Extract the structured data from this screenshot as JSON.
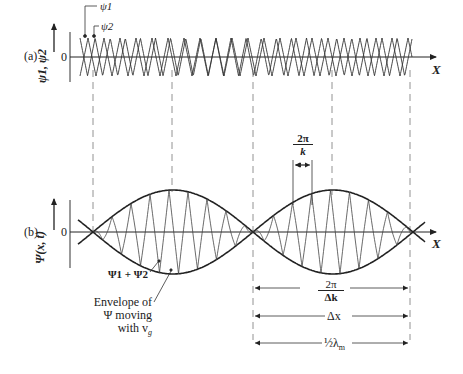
{
  "panel_a": {
    "label": "(a)",
    "y_axis_label": "ψ1, ψ2",
    "zero_label": "0",
    "x_axis_label": "X",
    "wave_labels": [
      "ψ1",
      "ψ2"
    ]
  },
  "panel_b": {
    "label": "(b)",
    "y_axis_label": "Ψ(x, t)",
    "zero_label": "0",
    "x_axis_label": "X",
    "sum_label": "Ψ1 + Ψ2",
    "envelope_label_lines": [
      "Envelope of",
      "Ψ moving",
      "with v"
    ],
    "envelope_subscript": "g",
    "carrier_period_num": "2π",
    "carrier_period_den": "k",
    "dimension_labels": {
      "envelope_period_num": "2π",
      "envelope_period_den": "Δk",
      "delta_x": "Δx",
      "half_lambda": "½λ",
      "half_lambda_sub": "m"
    }
  },
  "colors": {
    "ink": "#222222",
    "guide": "#777777",
    "background": "#ffffff"
  }
}
